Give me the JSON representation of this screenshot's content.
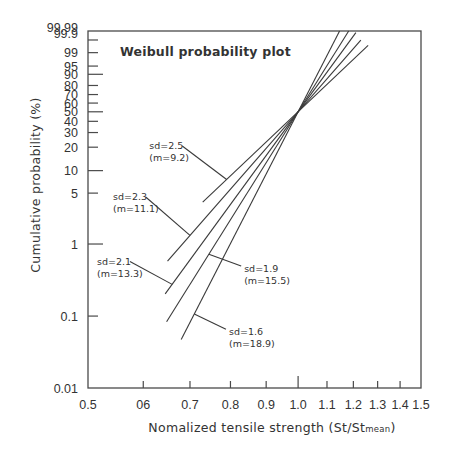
{
  "chart_data": {
    "type": "line",
    "title": "Weibull probability plot",
    "xlabel": "Nomalized tensile strength (St/St",
    "xlabel_subscript": "mean",
    "xlabel_close": ")",
    "ylabel": "Cumulative probability  (%)",
    "x_scale": "log",
    "y_scale": "weibull",
    "xlim": [
      0.5,
      1.5
    ],
    "ylim": [
      0.01,
      99.99
    ],
    "x_ticks": [
      {
        "value": 0.5,
        "label": "0.5",
        "major": false
      },
      {
        "value": 0.6,
        "label": "06",
        "major": false
      },
      {
        "value": 0.7,
        "label": "0.7",
        "major": false
      },
      {
        "value": 0.8,
        "label": "0.8",
        "major": false
      },
      {
        "value": 0.9,
        "label": "0.9",
        "major": false
      },
      {
        "value": 1.0,
        "label": "1.0",
        "major": true
      },
      {
        "value": 1.1,
        "label": "1.1",
        "major": false
      },
      {
        "value": 1.2,
        "label": "1.2",
        "major": false
      },
      {
        "value": 1.3,
        "label": "1.3",
        "major": false
      },
      {
        "value": 1.4,
        "label": "1.4",
        "major": false
      },
      {
        "value": 1.5,
        "label": "1.5",
        "major": false
      }
    ],
    "y_ticks": [
      {
        "value": 99.99,
        "label": "99.99",
        "major": false
      },
      {
        "value": 99.9,
        "label": "99.9",
        "major": false
      },
      {
        "value": 99,
        "label": "99",
        "major": false
      },
      {
        "value": 95,
        "label": "95",
        "major": false
      },
      {
        "value": 90,
        "label": "90",
        "major": true
      },
      {
        "value": 80,
        "label": "80",
        "major": false
      },
      {
        "value": 70,
        "label": "70",
        "major": false
      },
      {
        "value": 60,
        "label": "60",
        "major": false
      },
      {
        "value": 50,
        "label": "50",
        "major": true
      },
      {
        "value": 40,
        "label": "40",
        "major": false
      },
      {
        "value": 30,
        "label": "30",
        "major": false
      },
      {
        "value": 20,
        "label": "20",
        "major": false
      },
      {
        "value": 10,
        "label": "10",
        "major": true
      },
      {
        "value": 5,
        "label": "5",
        "major": false
      },
      {
        "value": 1,
        "label": "1",
        "major": true
      },
      {
        "value": 0.1,
        "label": "0.1",
        "major": false
      },
      {
        "value": 0.01,
        "label": "0.01",
        "major": false
      }
    ],
    "grid": false,
    "pivot": {
      "x": 1.0,
      "y_percent": 50
    },
    "series": [
      {
        "name": "sd=2.5 (m=9.2)",
        "sd": 2.5,
        "m": 9.2,
        "x_range": [
          0.73,
          1.26
        ]
      },
      {
        "name": "sd=2.3 (m=11.1)",
        "sd": 2.3,
        "m": 11.1,
        "x_range": [
          0.65,
          1.23
        ]
      },
      {
        "name": "sd=2.1 (m=13.3)",
        "sd": 2.1,
        "m": 13.3,
        "x_range": [
          0.645,
          1.21
        ]
      },
      {
        "name": "sd=1.9 (m=15.5)",
        "sd": 1.9,
        "m": 15.5,
        "x_range": [
          0.648,
          1.19
        ]
      },
      {
        "name": "sd=1.6 (m=18.9)",
        "sd": 1.6,
        "m": 18.9,
        "x_range": [
          0.68,
          1.17
        ]
      }
    ],
    "annotations": [
      {
        "series": 0,
        "line1": "sd=2.5",
        "line2": "(m=9.2)",
        "text_x": 0.612,
        "text_y_percent": 19,
        "target_x": 0.79
      },
      {
        "series": 1,
        "line1": "sd=2.3",
        "line2": "(m=11.1)",
        "text_x": 0.543,
        "text_y_percent": 4,
        "target_x": 0.7
      },
      {
        "series": 2,
        "line1": "sd=2.1",
        "line2": "(m=13.3)",
        "text_x": 0.515,
        "text_y_percent": 0.52,
        "target_x": 0.66
      },
      {
        "series": 3,
        "line1": "sd=1.9",
        "line2": "(m=15.5)",
        "text_x": 0.837,
        "text_y_percent": 0.41,
        "target_x": 0.745
      },
      {
        "series": 4,
        "line1": "sd=1.6",
        "line2": "(m=18.9)",
        "text_x": 0.796,
        "text_y_percent": 0.054,
        "target_x": 0.71
      }
    ]
  }
}
